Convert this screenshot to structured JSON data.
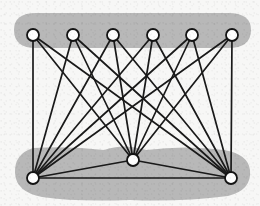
{
  "figure": {
    "width": 260,
    "height": 206,
    "background_color": "#f7f7f6"
  },
  "style": {
    "blob_color": "#b8b8b8",
    "edge_color": "#1a1a1a",
    "edge_width": 1.7,
    "node_fill": "#fdfdfd",
    "node_stroke": "#141414",
    "node_stroke_width": 1.8,
    "node_radius": 6.0
  },
  "chart_data": {
    "type": "diagram",
    "graph_kind": "bipartite-plus-triangle",
    "top_group_size": 6,
    "bottom_group_size": 3,
    "edge_count": 21,
    "nodes": [
      {
        "id": "t1",
        "group": "top",
        "label": "",
        "x": 33,
        "y": 35
      },
      {
        "id": "t2",
        "group": "top",
        "label": "",
        "x": 73,
        "y": 35
      },
      {
        "id": "t3",
        "group": "top",
        "label": "",
        "x": 113,
        "y": 35
      },
      {
        "id": "t4",
        "group": "top",
        "label": "",
        "x": 153,
        "y": 35
      },
      {
        "id": "t5",
        "group": "top",
        "label": "",
        "x": 192,
        "y": 35
      },
      {
        "id": "t6",
        "group": "top",
        "label": "",
        "x": 232,
        "y": 35
      },
      {
        "id": "b1",
        "group": "bottom",
        "label": "",
        "x": 33,
        "y": 178
      },
      {
        "id": "b2",
        "group": "bottom",
        "label": "",
        "x": 133,
        "y": 160
      },
      {
        "id": "b3",
        "group": "bottom",
        "label": "",
        "x": 231,
        "y": 178
      }
    ],
    "edges": [
      {
        "from": "t1",
        "to": "b1"
      },
      {
        "from": "t1",
        "to": "b2"
      },
      {
        "from": "t1",
        "to": "b3"
      },
      {
        "from": "t2",
        "to": "b1"
      },
      {
        "from": "t2",
        "to": "b2"
      },
      {
        "from": "t2",
        "to": "b3"
      },
      {
        "from": "t3",
        "to": "b1"
      },
      {
        "from": "t3",
        "to": "b2"
      },
      {
        "from": "t3",
        "to": "b3"
      },
      {
        "from": "t4",
        "to": "b1"
      },
      {
        "from": "t4",
        "to": "b2"
      },
      {
        "from": "t4",
        "to": "b3"
      },
      {
        "from": "t5",
        "to": "b1"
      },
      {
        "from": "t5",
        "to": "b2"
      },
      {
        "from": "t5",
        "to": "b3"
      },
      {
        "from": "t6",
        "to": "b1"
      },
      {
        "from": "t6",
        "to": "b2"
      },
      {
        "from": "t6",
        "to": "b3"
      },
      {
        "from": "b1",
        "to": "b2"
      },
      {
        "from": "b2",
        "to": "b3"
      },
      {
        "from": "b1",
        "to": "b3"
      }
    ],
    "regions": [
      {
        "id": "top-region",
        "label": "",
        "shape": "rounded-capsule",
        "path": "M 36 13 L 228 13 Q 251 13 251 30 Q 251 48 228 48 L 36 48 Q 14 48 14 30 Q 14 13 36 13 Z"
      },
      {
        "id": "bottom-region",
        "label": "",
        "shape": "organic-blob",
        "path": "M 33 148 Q 70 146 104 150 Q 124 143 146 150 Q 186 145 224 150 Q 248 154 250 170 Q 252 190 228 196 Q 180 202 130 200 Q 74 202 42 197 Q 16 192 15 173 Q 14 154 33 148 Z"
      }
    ]
  }
}
